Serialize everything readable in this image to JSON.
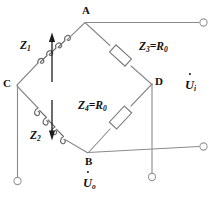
{
  "diagram": {
    "type": "circuit-schematic",
    "colors": {
      "wire": "#8a8a8a",
      "component_outline": "#7a7a7a",
      "arrow": "#1c1c1c",
      "text": "#111111",
      "background": "#ffffff"
    },
    "nodes": [
      {
        "id": "A",
        "label": "A",
        "x": 85,
        "y": 22
      },
      {
        "id": "B",
        "label": "B",
        "x": 88,
        "y": 153
      },
      {
        "id": "C",
        "label": "C",
        "x": 17,
        "y": 85
      },
      {
        "id": "D",
        "label": "D",
        "x": 152,
        "y": 84
      }
    ],
    "components": [
      {
        "id": "Z1",
        "label": "Z",
        "subscript": "1",
        "kind": "variable-inductor",
        "branch": "C-A",
        "arrow_direction": "up"
      },
      {
        "id": "Z2",
        "label": "Z",
        "subscript": "2",
        "kind": "variable-inductor",
        "branch": "C-B",
        "arrow_direction": "down"
      },
      {
        "id": "Z3",
        "label": "Z",
        "subscript": "3",
        "value_label": "=R",
        "value_subscript": "0",
        "full_label": "Z3=R0",
        "kind": "resistor",
        "branch": "A-D"
      },
      {
        "id": "Z4",
        "label": "Z",
        "subscript": "4",
        "value_label": "=R",
        "value_subscript": "0",
        "full_label": "Z4=R0",
        "kind": "resistor",
        "branch": "B-D"
      }
    ],
    "ports": [
      {
        "id": "Ui",
        "label": "U",
        "subscript": "i",
        "name": "input-voltage-phasor",
        "description": "U-dot sub i, input voltage across A and B terminals"
      },
      {
        "id": "Uo",
        "label": "U",
        "subscript": "o",
        "name": "output-voltage-phasor",
        "description": "U-dot sub o, output voltage across C and D terminals"
      }
    ],
    "terminals": [
      {
        "id": "T-A",
        "x": 204,
        "y": 22,
        "connects": "A"
      },
      {
        "id": "T-B",
        "x": 204,
        "y": 146,
        "connects": "B"
      },
      {
        "id": "T-C",
        "x": 17,
        "y": 181,
        "connects": "C"
      },
      {
        "id": "T-D",
        "x": 152,
        "y": 177,
        "connects": "D"
      }
    ]
  }
}
